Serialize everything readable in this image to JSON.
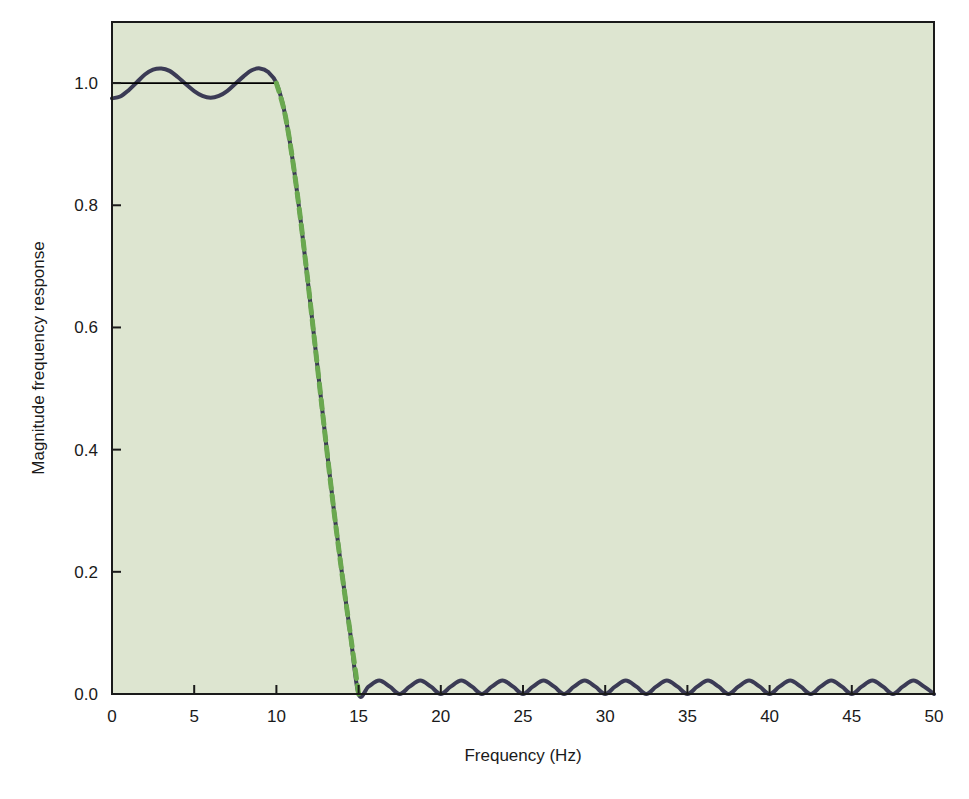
{
  "chart_data": {
    "type": "line",
    "title": "",
    "xlabel": "Frequency (Hz)",
    "ylabel": "Magnitude frequency response",
    "xlim": [
      0,
      50
    ],
    "ylim": [
      0.0,
      1.1
    ],
    "xticks": [
      0,
      5,
      10,
      15,
      20,
      25,
      30,
      35,
      40,
      45,
      50
    ],
    "xtick_labels": [
      "0",
      "5",
      "10",
      "15",
      "20",
      "25",
      "30",
      "35",
      "40",
      "45",
      "50"
    ],
    "yticks": [
      0.0,
      0.2,
      0.4,
      0.6,
      0.8,
      1.0
    ],
    "ytick_labels": [
      "0.0",
      "0.2",
      "0.4",
      "0.6",
      "0.8",
      "1.0"
    ],
    "grid": false,
    "legend": "none",
    "plot_background_color": "#dde5d0",
    "figure_background_color": "#ffffff",
    "axis_color": "#1a1a1a",
    "series": [
      {
        "name": "designed-filter-response",
        "style": "solid",
        "color": "#3b3b55",
        "line_width": 4.0,
        "description": "Equiripple lowpass FIR magnitude response: passband ripple about 1.0 for 0-10 Hz, steep transition 10-15 Hz, equiripple stopband near 0 for 15-50 Hz",
        "x": [
          0.0,
          0.5,
          1.0,
          1.5,
          2.0,
          2.5,
          3.0,
          3.5,
          4.0,
          4.5,
          5.0,
          5.5,
          6.0,
          6.5,
          7.0,
          7.5,
          8.0,
          8.5,
          9.0,
          9.5,
          10.0,
          10.5,
          11.0,
          11.5,
          12.0,
          12.5,
          13.0,
          13.5,
          14.0,
          14.5,
          15.0,
          15.6,
          16.25,
          16.9,
          17.5,
          18.1,
          18.75,
          19.4,
          20.0,
          20.6,
          21.25,
          21.9,
          22.5,
          23.1,
          23.75,
          24.4,
          25.0,
          25.6,
          26.25,
          26.9,
          27.5,
          28.1,
          28.75,
          29.4,
          30.0,
          30.6,
          31.25,
          31.9,
          32.5,
          33.1,
          33.75,
          34.4,
          35.0,
          35.6,
          36.25,
          36.9,
          37.5,
          38.1,
          38.75,
          39.4,
          40.0,
          40.6,
          41.25,
          41.9,
          42.5,
          43.1,
          43.75,
          44.4,
          45.0,
          45.6,
          46.25,
          46.9,
          47.5,
          48.1,
          48.75,
          49.4,
          50.0
        ],
        "y": [
          0.975,
          0.978,
          0.988,
          1.001,
          1.014,
          1.022,
          1.024,
          1.02,
          1.01,
          0.998,
          0.987,
          0.979,
          0.976,
          0.979,
          0.987,
          0.999,
          1.011,
          1.021,
          1.024,
          1.018,
          1.0,
          0.952,
          0.872,
          0.77,
          0.655,
          0.535,
          0.415,
          0.3,
          0.195,
          0.098,
          0.0,
          0.012,
          0.022,
          0.012,
          0.0,
          0.012,
          0.022,
          0.012,
          0.0,
          0.012,
          0.022,
          0.012,
          0.0,
          0.012,
          0.022,
          0.012,
          0.0,
          0.012,
          0.022,
          0.012,
          0.0,
          0.012,
          0.022,
          0.012,
          0.0,
          0.012,
          0.022,
          0.012,
          0.0,
          0.012,
          0.022,
          0.012,
          0.0,
          0.012,
          0.022,
          0.012,
          0.0,
          0.012,
          0.022,
          0.012,
          0.0,
          0.012,
          0.022,
          0.012,
          0.0,
          0.012,
          0.022,
          0.012,
          0.0,
          0.012,
          0.022,
          0.012,
          0.0,
          0.012,
          0.022,
          0.012,
          0.0
        ]
      },
      {
        "name": "ideal-brickwall-reference",
        "style": "solid-thin",
        "color": "#000000",
        "line_width": 1.8,
        "description": "Thin black horizontal reference line at magnitude 1.0 spanning the passband 0-10 Hz",
        "x": [
          0.0,
          10.0
        ],
        "y": [
          1.0,
          1.0
        ]
      },
      {
        "name": "ideal-transition-band",
        "style": "dashed",
        "color": "#6aa84f",
        "line_width": 5.0,
        "description": "Green dashed ideal transition ramp from (10 Hz, 1.0) down to (15 Hz, 0.0), overlaid on the designed response rolloff",
        "x": [
          10.0,
          10.5,
          11.0,
          11.5,
          12.0,
          12.5,
          13.0,
          13.5,
          14.0,
          14.5,
          15.0
        ],
        "y": [
          1.0,
          0.952,
          0.872,
          0.77,
          0.655,
          0.535,
          0.415,
          0.3,
          0.195,
          0.098,
          0.0
        ]
      }
    ]
  }
}
